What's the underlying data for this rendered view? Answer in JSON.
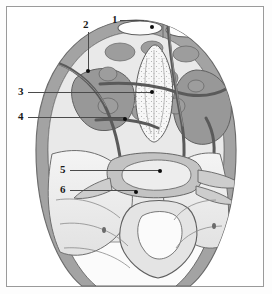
{
  "figure": {
    "orientation": "axial",
    "style": "grayscale line-and-tone anatomical illustration",
    "border_color": "#9a9a9a",
    "background_color": "#ffffff"
  },
  "palette": {
    "outline": "#5c5c5c",
    "dark_gray": "#8c8c8c",
    "mid_gray": "#a8a8a8",
    "light_gray": "#cfcfcf",
    "pale_gray": "#e6e6e6",
    "very_pale": "#f2f2f2",
    "vessel": "#6f6f6f",
    "label_text": "#1a1a1a",
    "leader_line": "#4b4b4b",
    "dot": "#0d0d0d"
  },
  "labels": [
    {
      "id": "1",
      "text": "1",
      "text_x": 112,
      "text_y": 14,
      "dot_x": 152,
      "dot_y": 27,
      "leader": [
        {
          "x": 120,
          "y": 20,
          "w": 24,
          "h": 1,
          "type": "h"
        }
      ]
    },
    {
      "id": "2",
      "text": "2",
      "text_x": 83,
      "text_y": 19,
      "dot_x": 88,
      "dot_y": 71,
      "leader": [
        {
          "x": 88,
          "y": 32,
          "w": 1,
          "h": 39,
          "type": "v"
        }
      ]
    },
    {
      "id": "3",
      "text": "3",
      "text_x": 18,
      "text_y": 86,
      "dot_x": 152,
      "dot_y": 92,
      "leader": [
        {
          "x": 28,
          "y": 92,
          "w": 124,
          "h": 1,
          "type": "h"
        }
      ]
    },
    {
      "id": "4",
      "text": "4",
      "text_x": 18,
      "text_y": 111,
      "dot_x": 125,
      "dot_y": 119,
      "leader": [
        {
          "x": 28,
          "y": 117,
          "w": 97,
          "h": 1,
          "type": "h"
        }
      ]
    },
    {
      "id": "5",
      "text": "5",
      "text_x": 60,
      "text_y": 164,
      "dot_x": 160,
      "dot_y": 171,
      "leader": [
        {
          "x": 70,
          "y": 170,
          "w": 90,
          "h": 1,
          "type": "h"
        }
      ]
    },
    {
      "id": "6",
      "text": "6",
      "text_x": 60,
      "text_y": 184,
      "dot_x": 136,
      "dot_y": 192,
      "leader": [
        {
          "x": 70,
          "y": 190,
          "w": 66,
          "h": 1,
          "type": "h"
        }
      ]
    }
  ],
  "regions": [
    {
      "name": "abdominal-wall-rim",
      "tone": "mid_gray"
    },
    {
      "name": "rectus-abdominis-left",
      "tone": "very_pale"
    },
    {
      "name": "rectus-abdominis-right",
      "tone": "very_pale"
    },
    {
      "name": "pelvic-mass-left",
      "tone": "dark_gray"
    },
    {
      "name": "pelvic-mass-right",
      "tone": "dark_gray"
    },
    {
      "name": "central-stippled-structure",
      "tone": "very_pale"
    },
    {
      "name": "bowel-loops",
      "tone": "mid_gray"
    },
    {
      "name": "gluteal-soft-tissue",
      "tone": "pale_gray"
    },
    {
      "name": "sacrum",
      "tone": "light_gray"
    },
    {
      "name": "vessels",
      "tone": "vessel"
    }
  ]
}
